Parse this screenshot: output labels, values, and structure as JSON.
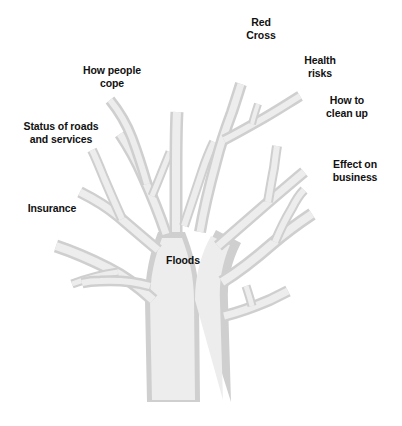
{
  "diagram": {
    "type": "tree-diagram",
    "root_label": "Floods",
    "colors": {
      "background": "#ffffff",
      "branch_fill": "#ececec",
      "branch_edge": "#cfcfcf",
      "text": "#111111"
    },
    "branches": [
      {
        "id": "red-cross",
        "label": "Red\nCross",
        "side": "top"
      },
      {
        "id": "health-risks",
        "label": "Health\nrisks",
        "side": "top-right"
      },
      {
        "id": "how-to-clean-up",
        "label": "How to\nclean up",
        "side": "right"
      },
      {
        "id": "effect-business",
        "label": "Effect on\nbusiness",
        "side": "right"
      },
      {
        "id": "how-people-cope",
        "label": "How people\ncope",
        "side": "top-left"
      },
      {
        "id": "status-roads",
        "label": "Status of roads\nand services",
        "side": "left"
      },
      {
        "id": "insurance",
        "label": "Insurance",
        "side": "left"
      }
    ]
  }
}
